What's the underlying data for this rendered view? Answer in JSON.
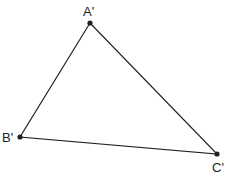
{
  "diagram": {
    "type": "triangle",
    "vertices": [
      {
        "name": "A",
        "label": "A'",
        "x": 90,
        "y": 23,
        "lx": 83,
        "ly": 16
      },
      {
        "name": "B",
        "label": "B'",
        "x": 20,
        "y": 137,
        "lx": 2,
        "ly": 142
      },
      {
        "name": "C",
        "label": "C'",
        "x": 217,
        "y": 154,
        "lx": 212,
        "ly": 172
      }
    ],
    "stroke_color": "#222222"
  }
}
